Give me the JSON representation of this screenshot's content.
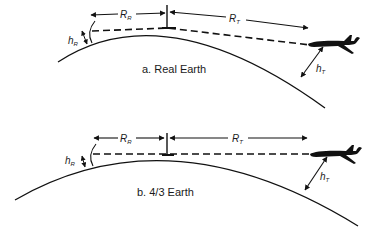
{
  "panels": [
    {
      "id": "a",
      "caption": "a. Real Earth",
      "labels": {
        "rr_main": "R",
        "rr_sub": "R",
        "rt_main": "R",
        "rt_sub": "T",
        "hr_main": "h",
        "hr_sub": "R",
        "ht_main": "h",
        "ht_sub": "T"
      }
    },
    {
      "id": "b",
      "caption": "b. 4/3 Earth",
      "labels": {
        "rr_main": "R",
        "rr_sub": "R",
        "rt_main": "R",
        "rt_sub": "T",
        "hr_main": "h",
        "hr_sub": "R",
        "ht_main": "h",
        "ht_sub": "T"
      }
    }
  ],
  "colors": {
    "stroke": "#111111",
    "background": "#ffffff"
  },
  "icons": {
    "aircraft": "airplane-icon",
    "radar": "antenna-mast-icon"
  }
}
